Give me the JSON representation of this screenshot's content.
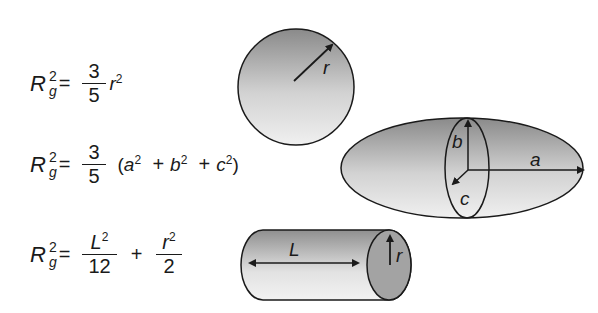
{
  "equations": [
    {
      "shape": "sphere",
      "lhs": {
        "symbol": "R",
        "superscript": "2",
        "subscript": "g"
      },
      "equals": "=",
      "fraction": {
        "numerator": "3",
        "denominator": "5"
      },
      "term": {
        "base": "r",
        "exp": "2"
      }
    },
    {
      "shape": "ellipsoid",
      "lhs": {
        "symbol": "R",
        "superscript": "2",
        "subscript": "g"
      },
      "equals": "=",
      "fraction": {
        "numerator": "3",
        "denominator": "5"
      },
      "paren_open": "(",
      "terms": [
        {
          "base": "a",
          "exp": "2"
        },
        {
          "base": "b",
          "exp": "2"
        },
        {
          "base": "c",
          "exp": "2"
        }
      ],
      "plus": "+",
      "paren_close": ")"
    },
    {
      "shape": "cylinder",
      "lhs": {
        "symbol": "R",
        "superscript": "2",
        "subscript": "g"
      },
      "equals": "=",
      "fraction1": {
        "numerator_base": "L",
        "numerator_exp": "2",
        "denominator": "12"
      },
      "plus": "+",
      "fraction2": {
        "numerator_base": "r",
        "numerator_exp": "2",
        "denominator": "2"
      }
    }
  ],
  "shapes": {
    "sphere": {
      "labels": {
        "radius": "r"
      }
    },
    "ellipsoid": {
      "labels": {
        "a": "a",
        "b": "b",
        "c": "c"
      }
    },
    "cylinder": {
      "labels": {
        "length": "L",
        "radius": "r"
      }
    }
  },
  "colors": {
    "outline": "#1a1a1a",
    "fill_dark": "#8e8e8e",
    "fill_light": "#ededed",
    "cap_fill": "#a0a0a0"
  }
}
